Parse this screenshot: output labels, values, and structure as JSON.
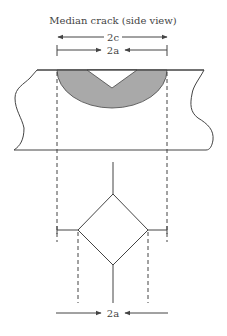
{
  "figure": {
    "title": "Median crack (side view)",
    "dimension_outer_label": "2c",
    "dimension_inner_label": "2a",
    "dimension_bottom_label": "2a"
  },
  "colors": {
    "line": "#444444",
    "crack_fill": "#a9a9a9",
    "background": "#ffffff"
  }
}
